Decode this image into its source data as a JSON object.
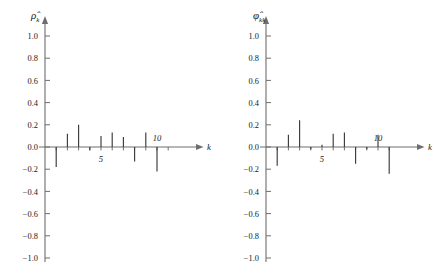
{
  "figure": {
    "background": "#ffffff",
    "stem_color": "#3a3a3a",
    "axis_color": "#6e6e6e"
  },
  "panels": [
    {
      "id": "acf",
      "ylabel": "ρ̂",
      "ylabel_sub": "k",
      "xlabel": "k",
      "y_ticks": [
        "1.0",
        "0.8",
        "0.6",
        "0.4",
        "0.2",
        "0.0",
        "−0.2",
        "−0.4",
        "−0.6",
        "−0.8",
        "−1.0"
      ],
      "x_ticks": [
        "5",
        "10"
      ],
      "x_tick_values": [
        5,
        10
      ]
    },
    {
      "id": "pacf",
      "ylabel": "φ̂",
      "ylabel_sub": "kk",
      "xlabel": "k",
      "y_ticks": [
        "1.0",
        "0.8",
        "0.6",
        "0.4",
        "0.2",
        "0.0",
        "−0.2",
        "−0.4",
        "−0.6",
        "−0.8",
        "−1.0"
      ],
      "x_ticks": [
        "5",
        "10"
      ],
      "x_tick_values": [
        5,
        10
      ]
    }
  ],
  "chart_data": [
    {
      "type": "bar",
      "title": "",
      "xlabel": "k",
      "ylabel": "ρ̂k",
      "ylim": [
        -1.0,
        1.0
      ],
      "xlim": [
        0,
        12
      ],
      "grid": false,
      "legend": false,
      "categories": [
        1,
        2,
        3,
        4,
        5,
        6,
        7,
        8,
        9,
        10
      ],
      "values": [
        -0.18,
        0.12,
        0.2,
        -0.03,
        0.1,
        0.13,
        0.09,
        -0.13,
        0.13,
        -0.22
      ],
      "ytick_labels": [
        "1.0",
        "0.8",
        "0.6",
        "0.4",
        "0.2",
        "0.0",
        "-0.2",
        "-0.4",
        "-0.6",
        "-0.8",
        "-1.0"
      ],
      "ytick_values": [
        1.0,
        0.8,
        0.6,
        0.4,
        0.2,
        0.0,
        -0.2,
        -0.4,
        -0.6,
        -0.8,
        -1.0
      ],
      "xtick_labels": [
        "5",
        "10"
      ],
      "xtick_values": [
        5,
        10
      ]
    },
    {
      "type": "bar",
      "title": "",
      "xlabel": "k",
      "ylabel": "φ̂kk",
      "ylim": [
        -1.0,
        1.0
      ],
      "xlim": [
        0,
        12
      ],
      "grid": false,
      "legend": false,
      "categories": [
        1,
        2,
        3,
        4,
        5,
        6,
        7,
        8,
        9,
        10,
        11
      ],
      "values": [
        -0.17,
        0.11,
        0.24,
        -0.02,
        0.02,
        0.12,
        0.13,
        -0.15,
        -0.02,
        0.11,
        -0.24
      ],
      "ytick_labels": [
        "1.0",
        "0.8",
        "0.6",
        "0.4",
        "0.2",
        "0.0",
        "-0.2",
        "-0.4",
        "-0.6",
        "-0.8",
        "-1.0"
      ],
      "ytick_values": [
        1.0,
        0.8,
        0.6,
        0.4,
        0.2,
        0.0,
        -0.2,
        -0.4,
        -0.6,
        -0.8,
        -1.0
      ],
      "xtick_labels": [
        "5",
        "10"
      ],
      "xtick_values": [
        5,
        10
      ]
    }
  ]
}
